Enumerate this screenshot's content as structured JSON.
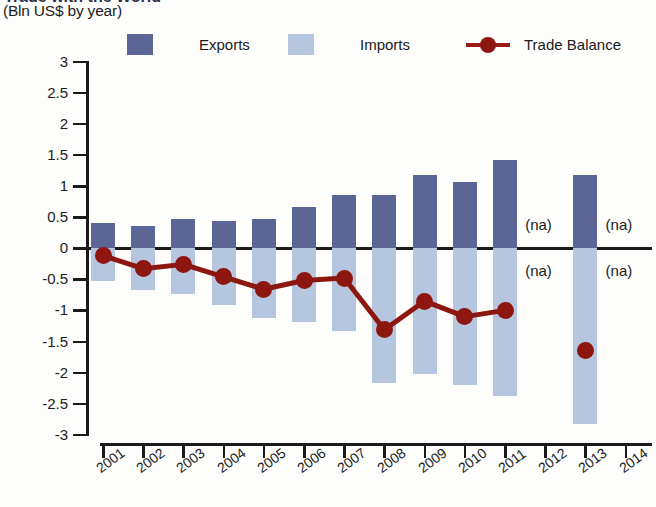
{
  "header": {
    "title_partial": "Trade with the World",
    "subtitle": "(Bln US$ by year)"
  },
  "legend": {
    "items": [
      {
        "label": "Exports",
        "type": "swatch",
        "color": "#5b6697"
      },
      {
        "label": "Imports",
        "type": "swatch",
        "color": "#b6c6de"
      },
      {
        "label": "Trade Balance",
        "type": "line",
        "color": "#8d1610"
      }
    ]
  },
  "annotations": {
    "na_text": "(na)",
    "na_positions": [
      {
        "year": "2012",
        "side": "above"
      },
      {
        "year": "2012",
        "side": "below"
      },
      {
        "year": "2014",
        "side": "above"
      },
      {
        "year": "2014",
        "side": "below"
      }
    ]
  },
  "chart_data": {
    "type": "bar",
    "title": "Trade with the World",
    "subtitle": "(Bln US$ by year)",
    "xlabel": "",
    "ylabel": "Bln US$",
    "ylim": [
      -3,
      3
    ],
    "ytick_step": 0.5,
    "ytick_labels": [
      "3",
      "2.5",
      "2",
      "1.5",
      "1",
      "0.5",
      "0",
      "-0.5",
      "-1",
      "-1.5",
      "-2",
      "-2.5",
      "-3"
    ],
    "ytick_values": [
      3,
      2.5,
      2,
      1.5,
      1,
      0.5,
      0,
      -0.5,
      -1,
      -1.5,
      -2,
      -2.5,
      -3
    ],
    "grid": false,
    "legend_position": "top",
    "categories": [
      "2001",
      "2002",
      "2003",
      "2004",
      "2005",
      "2006",
      "2007",
      "2008",
      "2009",
      "2010",
      "2011",
      "2012",
      "2013",
      "2014"
    ],
    "series": [
      {
        "name": "Exports",
        "type": "bar",
        "color": "#5b6697",
        "values": [
          0.4,
          0.35,
          0.47,
          0.44,
          0.47,
          0.66,
          0.85,
          0.86,
          1.17,
          1.06,
          1.42,
          null,
          1.18,
          null
        ]
      },
      {
        "name": "Imports",
        "type": "bar",
        "color": "#b6c6de",
        "values": [
          -0.52,
          -0.68,
          -0.74,
          -0.92,
          -1.13,
          -1.18,
          -1.33,
          -2.17,
          -2.02,
          -2.2,
          -2.38,
          null,
          -2.83,
          null
        ]
      },
      {
        "name": "Trade Balance",
        "type": "line",
        "color": "#8d1610",
        "values": [
          -0.12,
          -0.33,
          -0.26,
          -0.46,
          -0.66,
          -0.52,
          -0.48,
          -1.31,
          -0.85,
          -1.1,
          -1.0,
          null,
          -1.65,
          null
        ]
      }
    ]
  }
}
